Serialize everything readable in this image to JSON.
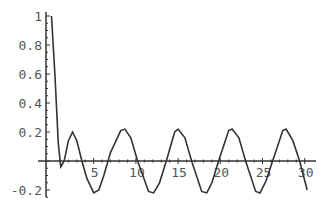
{
  "chart_data": {
    "type": "line",
    "title": "",
    "xlabel": "",
    "ylabel": "",
    "xlim": [
      0,
      30.5
    ],
    "ylim": [
      -0.27,
      1.02
    ],
    "grid": false,
    "legend": null,
    "x_ticks": [
      "5",
      "10",
      "15",
      "20",
      "25",
      "30"
    ],
    "y_ticks": [
      "1",
      "0.8",
      "0.6",
      "0.4",
      "0.2",
      "-0.2"
    ],
    "series": [
      {
        "name": "f(x)",
        "color": "#333333",
        "x": [
          0.0,
          0.4,
          0.8,
          1.1,
          1.5,
          2.0,
          2.5,
          3.0,
          3.6,
          4.2,
          5.0,
          5.6,
          6.2,
          7.0,
          8.2,
          8.7,
          9.4,
          10.2,
          11.5,
          12.1,
          12.8,
          13.6,
          14.6,
          15.0,
          15.8,
          16.6,
          17.8,
          18.4,
          19.0,
          19.8,
          21.0,
          21.4,
          22.2,
          23.0,
          24.2,
          24.7,
          25.4,
          26.2,
          27.4,
          27.8,
          28.6,
          29.4,
          30.3
        ],
        "y": [
          1.0,
          0.6,
          0.12,
          -0.04,
          0.0,
          0.14,
          0.2,
          0.14,
          0.0,
          -0.12,
          -0.22,
          -0.2,
          -0.1,
          0.06,
          0.21,
          0.22,
          0.16,
          0.0,
          -0.21,
          -0.22,
          -0.15,
          0.0,
          0.2,
          0.22,
          0.16,
          0.0,
          -0.21,
          -0.22,
          -0.15,
          0.0,
          0.21,
          0.22,
          0.16,
          0.0,
          -0.21,
          -0.22,
          -0.14,
          0.0,
          0.21,
          0.22,
          0.14,
          0.0,
          -0.2
        ]
      }
    ]
  }
}
